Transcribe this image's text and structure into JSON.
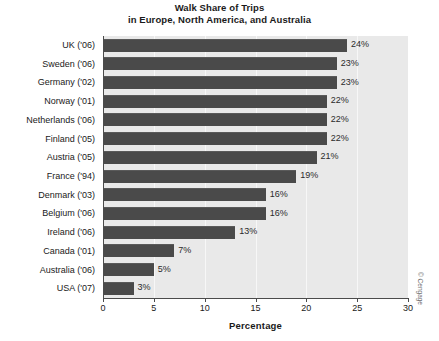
{
  "chart_data": {
    "type": "bar",
    "orientation": "horizontal",
    "title": "Walk Share of Trips in Europe, North America, and Australia",
    "title_line1": "Walk Share of Trips",
    "title_line2": "in Europe, North America, and Australia",
    "xlabel": "Percentage",
    "ylabel": "",
    "xlim": [
      0,
      30
    ],
    "xticks": [
      0,
      5,
      10,
      15,
      20,
      25,
      30
    ],
    "xtick_labels": [
      "0",
      "5",
      "10",
      "15",
      "20",
      "25",
      "30"
    ],
    "grid": true,
    "legend": "none",
    "value_suffix": "%",
    "categories": [
      "UK ('06)",
      "Sweden ('06)",
      "Germany ('02)",
      "Norway ('01)",
      "Netherlands ('06)",
      "Finland ('05)",
      "Austria ('05)",
      "France ('94)",
      "Denmark ('03)",
      "Belgium ('06)",
      "Ireland ('06)",
      "Canada ('01)",
      "Australia ('06)",
      "USA ('07)"
    ],
    "values": [
      24,
      23,
      23,
      22,
      22,
      22,
      21,
      19,
      16,
      16,
      13,
      7,
      5,
      3
    ],
    "value_labels": [
      "24%",
      "23%",
      "23%",
      "22%",
      "22%",
      "22%",
      "21%",
      "19%",
      "16%",
      "16%",
      "13%",
      "7%",
      "5%",
      "3%"
    ],
    "bar_color": "#4a4a4a",
    "plot_background": "#e9e9e9",
    "gridline_color": "#f7f7f7"
  },
  "credit": "© Cengage"
}
